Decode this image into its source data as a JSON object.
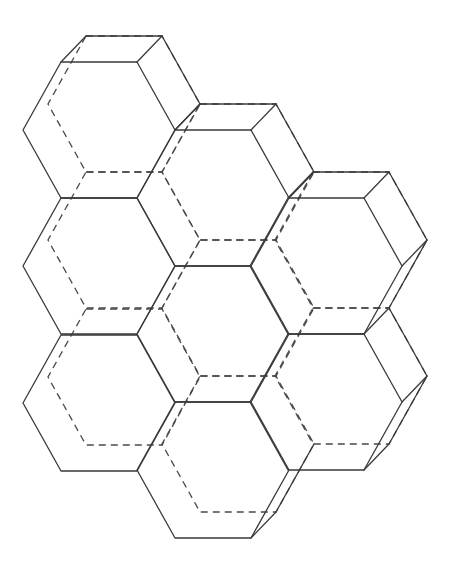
{
  "diagram": {
    "title": "Honeycomb of hexagonal prisms (3D wireframe)",
    "type": "hexagonal-prism-cluster",
    "cell_count": 8,
    "hex": {
      "half_width": 76,
      "half_side": 38,
      "half_height": 68
    },
    "depth_offset": {
      "dx": 25,
      "dy": -26
    },
    "colors": {
      "line": "#3a3a3a",
      "background": "#ffffff"
    },
    "cells": [
      {
        "id": "A",
        "cx": 99,
        "cy": 130,
        "visible_back_edges": [
          [
            0,
            1
          ],
          [
            1,
            2
          ]
        ],
        "connectors": [
          0,
          1,
          2
        ]
      },
      {
        "id": "B",
        "cx": 213,
        "cy": 198,
        "visible_back_edges": [
          [
            0,
            1
          ],
          [
            1,
            2
          ]
        ],
        "connectors": [
          0,
          1,
          2
        ]
      },
      {
        "id": "C",
        "cx": 326,
        "cy": 266,
        "visible_back_edges": [
          [
            0,
            1
          ],
          [
            1,
            2
          ],
          [
            2,
            3
          ]
        ],
        "connectors": [
          0,
          1,
          2,
          3
        ]
      },
      {
        "id": "D",
        "cx": 99,
        "cy": 266,
        "visible_back_edges": [],
        "connectors": []
      },
      {
        "id": "E",
        "cx": 213,
        "cy": 334,
        "visible_back_edges": [],
        "connectors": []
      },
      {
        "id": "F",
        "cx": 326,
        "cy": 402,
        "visible_back_edges": [
          [
            1,
            2
          ],
          [
            2,
            3
          ]
        ],
        "connectors": [
          2,
          3
        ]
      },
      {
        "id": "G",
        "cx": 99,
        "cy": 403,
        "visible_back_edges": [],
        "connectors": []
      },
      {
        "id": "H",
        "cx": 213,
        "cy": 470,
        "visible_back_edges": [
          [
            2,
            3
          ]
        ],
        "connectors": [
          3
        ]
      }
    ]
  }
}
